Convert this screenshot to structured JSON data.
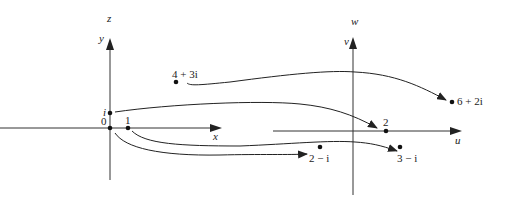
{
  "diagram": {
    "z_plane": {
      "plane_label": "z",
      "x_axis_label": "x",
      "y_axis_label": "y",
      "origin_label": "0",
      "points": [
        {
          "label": "i"
        },
        {
          "label": "1"
        },
        {
          "label": "4 + 3i"
        }
      ]
    },
    "w_plane": {
      "plane_label": "w",
      "u_axis_label": "u",
      "v_axis_label": "v",
      "points": [
        {
          "label": "2"
        },
        {
          "label": "6 + 2i"
        },
        {
          "label": "2 − i"
        },
        {
          "label": "3 − i"
        }
      ]
    },
    "mappings": [
      {
        "from": "4 + 3i",
        "to": "6 + 2i"
      },
      {
        "from": "i",
        "to": "2"
      },
      {
        "from": "0",
        "to": "2 − i"
      },
      {
        "from": "1",
        "to": "3 − i"
      }
    ],
    "colors": {
      "ink": "#222222",
      "background": "#ffffff"
    }
  }
}
